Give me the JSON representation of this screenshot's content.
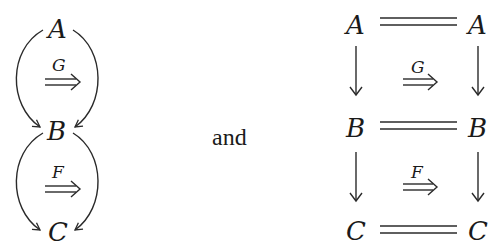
{
  "left_diagram": {
    "objects": [
      "A",
      "B",
      "C"
    ],
    "upper_two_cell": {
      "label": "G",
      "from": "A",
      "to": "B"
    },
    "lower_two_cell": {
      "label": "F",
      "from": "B",
      "to": "C"
    }
  },
  "connector": {
    "text": "and"
  },
  "right_diagram": {
    "rows": [
      {
        "left": "A",
        "right": "A"
      },
      {
        "left": "B",
        "right": "B"
      },
      {
        "left": "C",
        "right": "C"
      }
    ],
    "upper_square": {
      "label": "G"
    },
    "lower_square": {
      "label": "F"
    }
  },
  "colors": {
    "ink": "#1a1a1a",
    "background": "#ffffff"
  }
}
